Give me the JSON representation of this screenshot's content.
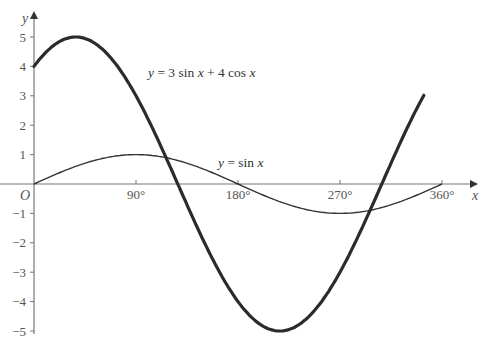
{
  "chart_data": {
    "type": "line",
    "title": "",
    "xlabel": "x",
    "ylabel": "y",
    "xlim": [
      0,
      360
    ],
    "ylim": [
      -5,
      5
    ],
    "x_ticks": [
      90,
      180,
      270,
      360
    ],
    "x_tick_labels": [
      "90°",
      "180°",
      "270°",
      "360°"
    ],
    "y_ticks": [
      -5,
      -4,
      -3,
      -2,
      -1,
      1,
      2,
      3,
      4,
      5
    ],
    "y_tick_labels": [
      "−5",
      "−4",
      "−3",
      "−2",
      "−1",
      "1",
      "2",
      "3",
      "4",
      "5"
    ],
    "origin_label": "O",
    "grid": false,
    "series": [
      {
        "name": "y = 3 sin x + 4 cos x",
        "label_parts": [
          "y",
          " = 3 sin ",
          "x",
          " + 4 cos ",
          "x"
        ],
        "stroke_width": 3.2,
        "color": "#2b2b2b",
        "x": [
          0,
          36.87,
          90,
          126.87,
          180,
          216.87,
          270,
          306.87,
          360
        ],
        "values": [
          4,
          5,
          3,
          0,
          -4,
          -5,
          -3,
          0,
          4
        ],
        "plotted_range": [
          0,
          345
        ]
      },
      {
        "name": "y = sin x",
        "label_parts": [
          "y",
          " = sin ",
          "x"
        ],
        "stroke_width": 1.4,
        "color": "#333333",
        "x": [
          0,
          90,
          180,
          270,
          360
        ],
        "values": [
          0,
          1,
          0,
          -1,
          0
        ]
      }
    ],
    "annotations": [
      {
        "text": "y = 3 sin x + 4 cos x",
        "near_x": 145,
        "near_y": 3.6
      },
      {
        "text": "y = sin x",
        "near_x": 200,
        "near_y": 0.8
      }
    ]
  },
  "colors": {
    "axis": "#777777",
    "thick_curve": "#2b2b2b",
    "thin_curve": "#333333"
  }
}
